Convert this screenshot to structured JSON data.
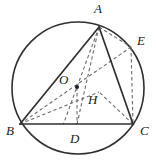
{
  "figure": {
    "kind": "geometry-diagram",
    "width": 156,
    "height": 163,
    "background_color": "#ffffff",
    "stroke_color": "#302f2e",
    "dash_color": "#6d6c6a",
    "label_color": "#20201f"
  },
  "circle": {
    "name": "circumcircle",
    "cx": 78,
    "cy": 88,
    "r": 66,
    "stroke_width": 1.6
  },
  "points": [
    {
      "id": "A",
      "label": "A",
      "x": 99,
      "y": 27,
      "label_x": 94,
      "label_y": 2,
      "dot": false
    },
    {
      "id": "B",
      "label": "B",
      "x": 20,
      "y": 124,
      "label_x": 6,
      "label_y": 124,
      "dot": false
    },
    {
      "id": "C",
      "label": "C",
      "x": 133,
      "y": 124,
      "label_x": 140,
      "label_y": 124,
      "dot": false
    },
    {
      "id": "D",
      "label": "D",
      "x": 77,
      "y": 124,
      "label_x": 70,
      "label_y": 132,
      "dot": false
    },
    {
      "id": "E",
      "label": "E",
      "x": 131,
      "y": 47,
      "label_x": 137,
      "label_y": 34,
      "dot": false
    },
    {
      "id": "O",
      "label": "O",
      "x": 77,
      "y": 87,
      "label_x": 59,
      "label_y": 73,
      "dot": true
    },
    {
      "id": "H",
      "label": "H",
      "x": 99,
      "y": 92,
      "label_x": 88,
      "label_y": 93,
      "dot": false
    }
  ],
  "segments_solid": [
    {
      "name": "segment-AB",
      "from": "A",
      "to": "B"
    },
    {
      "name": "segment-AC",
      "from": "A",
      "to": "C"
    },
    {
      "name": "segment-BC",
      "from": "B",
      "to": "C"
    },
    {
      "name": "segment-BE",
      "from": "B",
      "to": "E"
    }
  ],
  "segments_dashed": [
    {
      "name": "segment-AD-altitude",
      "from": "A",
      "to": "D"
    },
    {
      "name": "segment-AE",
      "from": "A",
      "to": "E"
    },
    {
      "name": "segment-OD",
      "from": "O",
      "to": "D"
    },
    {
      "name": "segment-BH",
      "from": "B",
      "to": "H"
    },
    {
      "name": "segment-CH",
      "from": "C",
      "to": "H"
    },
    {
      "name": "segment-EC",
      "from": "E",
      "to": "C"
    },
    {
      "name": "segment-AO-extended",
      "from": "A",
      "to": "Oext"
    }
  ]
}
